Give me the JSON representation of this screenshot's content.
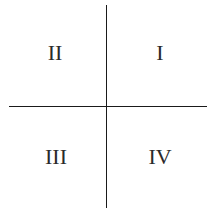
{
  "diagram": {
    "type": "cartesian-quadrants",
    "axes": {
      "vertical": {
        "x": 106,
        "y_start": 5,
        "y_end": 207,
        "color": "#1a1a1a"
      },
      "horizontal": {
        "y": 106,
        "x_start": 9,
        "x_end": 206,
        "color": "#1a1a1a"
      }
    },
    "quadrants": [
      {
        "id": "q2",
        "label": "II",
        "position": "top-left"
      },
      {
        "id": "q1",
        "label": "I",
        "position": "top-right"
      },
      {
        "id": "q3",
        "label": "III",
        "position": "bottom-left"
      },
      {
        "id": "q4",
        "label": "IV",
        "position": "bottom-right"
      }
    ],
    "label_color": "#2a2a2a",
    "background": "#ffffff"
  }
}
